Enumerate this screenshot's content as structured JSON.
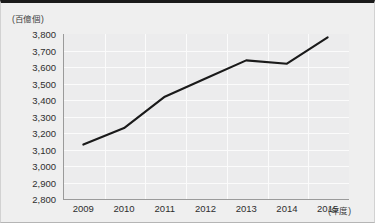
{
  "chart_data": {
    "type": "line",
    "title": "",
    "subtitle": "",
    "xlabel": "(年度)",
    "ylabel": "(百億個)",
    "unit_caption": "(百億個)",
    "grid": true,
    "legend": false,
    "categories": [
      "2009",
      "2010",
      "2011",
      "2012",
      "2013",
      "2014",
      "2015"
    ],
    "x": [
      2009,
      2010,
      2011,
      2012,
      2013,
      2014,
      2015
    ],
    "values": [
      3130,
      3230,
      3420,
      3530,
      3640,
      3620,
      3780
    ],
    "series": [
      {
        "name": "数量",
        "values": [
          3130,
          3230,
          3420,
          3530,
          3640,
          3620,
          3780
        ]
      }
    ],
    "ylim": [
      2800,
      3800
    ],
    "ytick_labels": [
      "3,800",
      "3,700",
      "3,600",
      "3,500",
      "3,400",
      "3,300",
      "3,200",
      "3,100",
      "3,000",
      "2,900",
      "2,800"
    ],
    "ytick_values": [
      3800,
      3700,
      3600,
      3500,
      3400,
      3300,
      3200,
      3100,
      3000,
      2900,
      2800
    ],
    "line_color": "#1a1a1a",
    "plot_background": "#ececed",
    "gridline_color": "#fbfbfb",
    "axis_color": "#9a9a9a"
  }
}
